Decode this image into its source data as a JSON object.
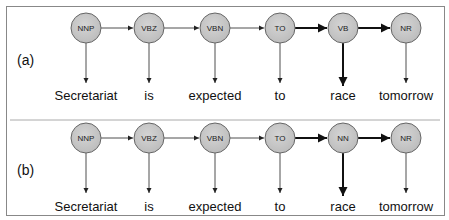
{
  "diagram": {
    "panels": [
      {
        "label": "(a)",
        "tags": [
          "NNP",
          "VBZ",
          "VBN",
          "TO",
          "VB",
          "NR"
        ],
        "words": [
          "Secretariat",
          "is",
          "expected",
          "to",
          "race",
          "tomorrow"
        ],
        "bold_transitions": [
          3,
          4
        ],
        "bold_emission": 4
      },
      {
        "label": "(b)",
        "tags": [
          "NNP",
          "VBZ",
          "VBN",
          "TO",
          "NN",
          "NR"
        ],
        "words": [
          "Secretariat",
          "is",
          "expected",
          "to",
          "race",
          "tomorrow"
        ],
        "bold_transitions": [
          3,
          4
        ],
        "bold_emission": 4
      }
    ],
    "colors": {
      "node_fill": "#c8c8c8",
      "node_stroke": "#666666",
      "edge": "#222222",
      "frame": "#888888",
      "divider": "#aaaaaa"
    }
  }
}
